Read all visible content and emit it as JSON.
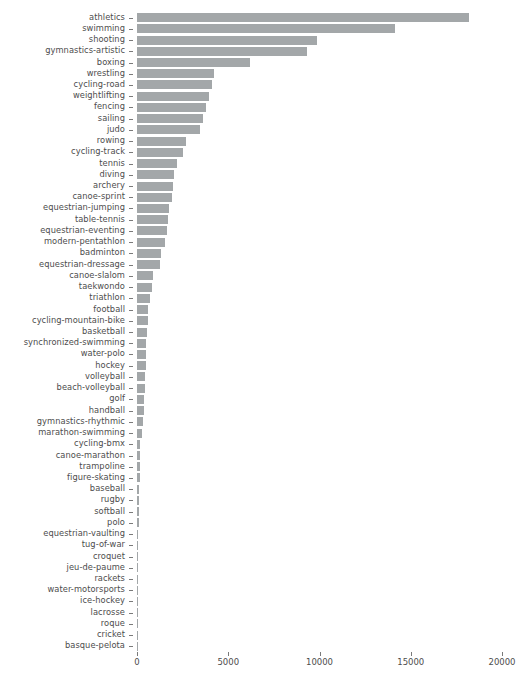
{
  "chart_data": {
    "type": "bar",
    "orientation": "horizontal",
    "title": "",
    "subtitle": "",
    "xlabel": "",
    "ylabel": "",
    "xlim": [
      0,
      20000
    ],
    "ylim": null,
    "grid": false,
    "legend": null,
    "legend_position": "none",
    "bar_color": "#a3a7a9",
    "background_color": "#ffffff",
    "tick_color": "#4d4d4d",
    "xticks": [
      0,
      5000,
      10000,
      15000,
      20000
    ],
    "xtick_labels": [
      "0",
      "5000",
      "10000",
      "15000",
      "20000"
    ],
    "categories": [
      "athletics",
      "swimming",
      "shooting",
      "gymnastics-artistic",
      "boxing",
      "wrestling",
      "cycling-road",
      "weightlifting",
      "fencing",
      "sailing",
      "judo",
      "rowing",
      "cycling-track",
      "tennis",
      "diving",
      "archery",
      "canoe-sprint",
      "equestrian-jumping",
      "table-tennis",
      "equestrian-eventing",
      "modern-pentathlon",
      "badminton",
      "equestrian-dressage",
      "canoe-slalom",
      "taekwondo",
      "triathlon",
      "football",
      "cycling-mountain-bike",
      "basketball",
      "synchronized-swimming",
      "water-polo",
      "hockey",
      "volleyball",
      "beach-volleyball",
      "golf",
      "handball",
      "gymnastics-rhythmic",
      "marathon-swimming",
      "cycling-bmx",
      "canoe-marathon",
      "trampoline",
      "figure-skating",
      "baseball",
      "rugby",
      "softball",
      "polo",
      "equestrian-vaulting",
      "tug-of-war",
      "croquet",
      "jeu-de-paume",
      "rackets",
      "water-motorsports",
      "ice-hockey",
      "lacrosse",
      "roque",
      "cricket",
      "basque-pelota"
    ],
    "values": [
      18200,
      14150,
      9850,
      9300,
      6200,
      4230,
      4100,
      3950,
      3780,
      3620,
      3450,
      2700,
      2500,
      2180,
      2050,
      1950,
      1900,
      1780,
      1700,
      1640,
      1560,
      1320,
      1250,
      870,
      800,
      700,
      620,
      580,
      540,
      510,
      480,
      470,
      450,
      430,
      410,
      390,
      350,
      250,
      180,
      160,
      150,
      140,
      130,
      120,
      110,
      90,
      80,
      70,
      60,
      55,
      50,
      45,
      40,
      35,
      30,
      25,
      20
    ]
  }
}
